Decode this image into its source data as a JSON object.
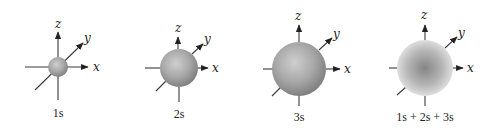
{
  "figure": {
    "axis_labels": {
      "x": "x",
      "y": "y",
      "z": "z"
    },
    "panels": [
      {
        "id": "1s",
        "caption": "1s",
        "cx": 58,
        "cy": 67,
        "r": 10,
        "style": "shaded"
      },
      {
        "id": "2s",
        "caption": "2s",
        "cx": 179,
        "cy": 68,
        "r": 19,
        "style": "shaded"
      },
      {
        "id": "3s",
        "caption": "3s",
        "cx": 299,
        "cy": 69,
        "r": 27,
        "style": "shaded"
      },
      {
        "id": "sum",
        "caption": "1s + 2s + 3s",
        "cx": 425,
        "cy": 68,
        "r": 28,
        "style": "diffuse"
      }
    ],
    "colors": {
      "sphere_light": "#c8c8c8",
      "sphere_mid": "#a6a6a6",
      "sphere_dark": "#7e7e7e",
      "diffuse_center": "#8a8a8a",
      "diffuse_edge": "#dcdcdc",
      "axis": "#3a3a3a"
    }
  }
}
